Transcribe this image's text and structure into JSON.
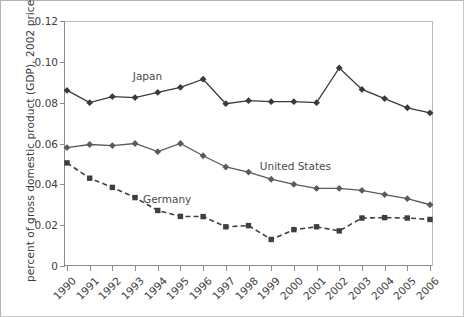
{
  "chart_data": {
    "type": "line",
    "title": "",
    "xlabel": "",
    "ylabel": "percent of gross domestic product (GDP), 2002 prices",
    "categories": [
      "1990",
      "1991",
      "1992",
      "1993",
      "1994",
      "1995",
      "1996",
      "1997",
      "1998",
      "1999",
      "2000",
      "2001",
      "2002",
      "2003",
      "2004",
      "2005",
      "2006"
    ],
    "ylim": [
      0,
      0.12
    ],
    "yticks": [
      "0",
      "0.02",
      "0.04",
      "0.06",
      "0.08",
      "0.10",
      "0.12"
    ],
    "ytick_values": [
      0,
      0.02,
      0.04,
      0.06,
      0.08,
      0.1,
      0.12
    ],
    "grid": false,
    "legend_position": "inline-annotations",
    "series": [
      {
        "name": "Japan",
        "color": "#3a3a3a",
        "marker": "diamond",
        "dash": "solid",
        "label_x": 2.9,
        "label_y": 0.0925,
        "values": [
          0.086,
          0.08,
          0.083,
          0.0825,
          0.085,
          0.0875,
          0.0915,
          0.0795,
          0.081,
          0.0805,
          0.0805,
          0.08,
          0.097,
          0.0865,
          0.082,
          0.0775,
          0.075
        ]
      },
      {
        "name": "United States",
        "color": "#5a5a5a",
        "marker": "diamond",
        "dash": "solid",
        "label_x": 8.5,
        "label_y": 0.0485,
        "values": [
          0.058,
          0.0595,
          0.059,
          0.06,
          0.056,
          0.06,
          0.054,
          0.0485,
          0.046,
          0.0425,
          0.04,
          0.038,
          0.038,
          0.037,
          0.035,
          0.033,
          0.03
        ]
      },
      {
        "name": "Germany",
        "color": "#3f3f3f",
        "marker": "square",
        "dash": "dashed",
        "label_x": 3.35,
        "label_y": 0.0325,
        "values": [
          0.0505,
          0.043,
          0.0385,
          0.0335,
          0.0272,
          0.0243,
          0.0242,
          0.0192,
          0.0198,
          0.013,
          0.0178,
          0.0192,
          0.0172,
          0.0235,
          0.0237,
          0.0235,
          0.0228
        ]
      }
    ]
  }
}
